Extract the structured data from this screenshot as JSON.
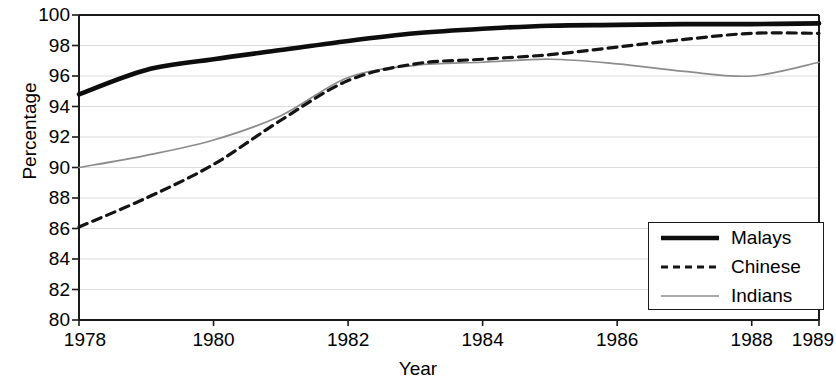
{
  "chart_data": {
    "type": "line",
    "title": "",
    "xlabel": "Year",
    "ylabel": "Percentage",
    "xlim": [
      1978,
      1989
    ],
    "ylim": [
      80,
      100
    ],
    "grid": true,
    "legend_position": "bottom-right",
    "x_ticks": [
      "1978",
      "1980",
      "1982",
      "1984",
      "1986",
      "1988",
      "1989"
    ],
    "x_tick_values": [
      1978,
      1980,
      1982,
      1984,
      1986,
      1988,
      1989
    ],
    "y_ticks": [
      "80",
      "82",
      "84",
      "86",
      "88",
      "90",
      "92",
      "94",
      "96",
      "98",
      "100"
    ],
    "y_tick_values": [
      80,
      82,
      84,
      86,
      88,
      90,
      92,
      94,
      96,
      98,
      100
    ],
    "x": [
      1978,
      1979,
      1980,
      1981,
      1982,
      1983,
      1984,
      1985,
      1986,
      1987,
      1988,
      1989
    ],
    "series": [
      {
        "name": "Malays",
        "style": "solid-thick",
        "color": "#0d0d0d",
        "values": [
          94.8,
          96.4,
          97.1,
          97.7,
          98.3,
          98.8,
          99.1,
          99.3,
          99.35,
          99.4,
          99.4,
          99.45
        ]
      },
      {
        "name": "Chinese",
        "style": "dashed",
        "color": "#141414",
        "values": [
          86.1,
          88.0,
          90.2,
          93.1,
          95.7,
          96.8,
          97.1,
          97.4,
          97.9,
          98.4,
          98.8,
          98.8
        ]
      },
      {
        "name": "Indians",
        "style": "solid-thin",
        "color": "#8c8c8c",
        "values": [
          90.0,
          90.8,
          91.8,
          93.4,
          95.9,
          96.7,
          96.9,
          97.1,
          96.8,
          96.3,
          96.0,
          96.9
        ]
      }
    ]
  },
  "axes": {
    "y_title": "Percentage",
    "x_title": "Year"
  },
  "legend": {
    "entries": [
      {
        "label": "Malays"
      },
      {
        "label": "Chinese"
      },
      {
        "label": "Indians"
      }
    ]
  }
}
